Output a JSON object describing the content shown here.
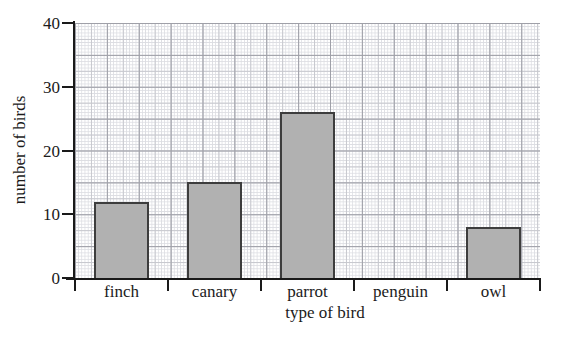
{
  "chart_data": {
    "type": "bar",
    "categories": [
      "finch",
      "canary",
      "parrot",
      "penguin",
      "owl"
    ],
    "values": [
      12,
      15,
      26,
      0,
      8
    ],
    "title": "",
    "xlabel": "type of bird",
    "ylabel": "number of birds",
    "ylim": [
      0,
      40
    ],
    "yticks": [
      0,
      10,
      20,
      30,
      40
    ],
    "grid": "fine graph paper with bold lines every 10 squares",
    "legend": "none",
    "bar_fill": "#b1b1b1",
    "bar_border": "#3d3d3d",
    "axis_color": "#1a1a1a",
    "text_color": "#1b1b1b",
    "background": "#ffffff"
  }
}
